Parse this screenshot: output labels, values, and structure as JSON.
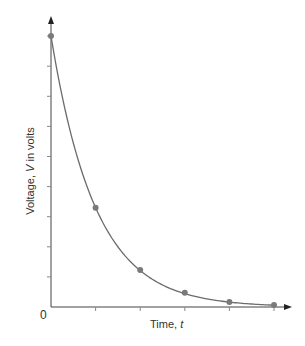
{
  "chart_data": {
    "type": "line",
    "title": "",
    "xlabel": "Time, t",
    "ylabel": "Voltage, V in volts",
    "origin_label": "0",
    "x": [
      0,
      1,
      2,
      3,
      4,
      5
    ],
    "values": [
      9.0,
      3.3,
      1.23,
      0.47,
      0.17,
      0.07
    ],
    "xlim": [
      0,
      5.4
    ],
    "ylim": [
      0,
      9.6
    ],
    "x_ticks": [
      0,
      1,
      2,
      3,
      4,
      5
    ],
    "y_ticks": [
      0,
      1,
      2,
      3,
      4,
      5,
      6,
      7,
      8,
      9
    ],
    "tick_labels_shown": false,
    "grid": false,
    "legend": null,
    "curve": "smooth exponential decay through points",
    "colors": {
      "curve": "#6b6b6b",
      "points": "#7a7a7a",
      "axes": "#444444"
    }
  }
}
